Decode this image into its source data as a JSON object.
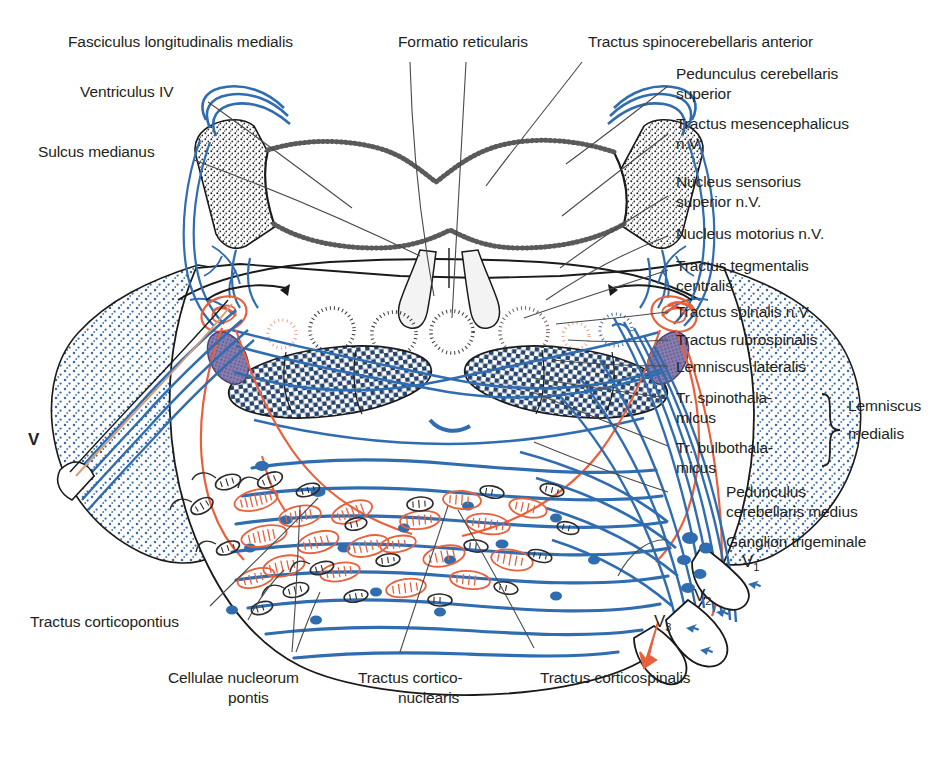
{
  "figure": {
    "background_color": "#ffffff",
    "colors": {
      "outline": "#1a1a1a",
      "leader_line": "#4a4a4a",
      "blue_tract": "#2f6cb0",
      "blue_stipple": "#3a6ba8",
      "blue_light": "#7aa6d4",
      "orange_nucleus": "#e8603c",
      "orange_light": "#f0a58c",
      "purple_nucleus": "#6b5f96",
      "text": "#231f20"
    }
  },
  "labels": {
    "top": [
      {
        "id": "fasciculus-longitudinalis-medialis",
        "text": "Fasciculus longitudinalis medialis"
      },
      {
        "id": "formatio-reticularis",
        "text": "Formatio reticularis"
      },
      {
        "id": "tractus-spinocerebellaris-anterior",
        "text": "Tractus spinocerebellaris anterior"
      }
    ],
    "left": [
      {
        "id": "ventriculus-iv",
        "text": "Ventriculus IV"
      },
      {
        "id": "sulcus-medianus",
        "text": "Sulcus medianus"
      },
      {
        "id": "v-root",
        "text": "V"
      },
      {
        "id": "tractus-corticopontius",
        "text": "Tractus corticopontius"
      }
    ],
    "right": [
      {
        "id": "pedunculus-cerebellaris-superior",
        "line1": "Pedunculus cerebellaris",
        "line2": "superior"
      },
      {
        "id": "tractus-mesencephalicus-nv",
        "line1": "Tractus mesencephalicus",
        "line2": "n.V."
      },
      {
        "id": "nucleus-sensorius-superior-nv",
        "line1": "Nucleus sensorius",
        "line2": "superior n.V."
      },
      {
        "id": "nucleus-motorius-nv",
        "line1": "Nucleus motorius n.V.",
        "line2": ""
      },
      {
        "id": "tractus-tegmentalis-centralis",
        "line1": "Tractus tegmentalis",
        "line2": "centralis"
      },
      {
        "id": "tractus-spinalis-nv",
        "line1": "Tractus spinalis n.V.",
        "line2": ""
      },
      {
        "id": "tractus-rubrospinalis",
        "line1": "Tractus rubrospinalis",
        "line2": ""
      },
      {
        "id": "lemniscus-lateralis",
        "line1": "Lemniscus lateralis",
        "line2": ""
      },
      {
        "id": "tr-spinothalamicus",
        "line1": "Tr. spinothala-",
        "line2": "mlcus"
      },
      {
        "id": "tr-bulbothalamicus",
        "line1": "Tr. bulbothala-",
        "line2": "micus"
      },
      {
        "id": "pedunculus-cerebellaris-medius",
        "line1": "Pedunculus",
        "line2": "cerebellaris medius"
      },
      {
        "id": "ganglion-trigeminale",
        "line1": "Ganglion trigeminale",
        "line2": ""
      }
    ],
    "brace_group": {
      "id": "lemniscus-medialis",
      "line1": "Lemniscus",
      "line2": "medialis"
    },
    "bottom": [
      {
        "id": "cellulae-nucleorum-pontis",
        "line1": "Cellulae nucleorum",
        "line2": "pontis"
      },
      {
        "id": "tractus-corticonuclearis",
        "line1": "Tractus cortico-",
        "line2": "nuclearis"
      },
      {
        "id": "tractus-corticospinalis",
        "line1": "Tractus corticospinalis",
        "line2": ""
      }
    ],
    "nerve_branches": [
      {
        "id": "v1",
        "base": "V",
        "sub": "1"
      },
      {
        "id": "v2",
        "base": "V",
        "sub": "2"
      },
      {
        "id": "v3",
        "base": "V",
        "sub": "3"
      }
    ]
  }
}
